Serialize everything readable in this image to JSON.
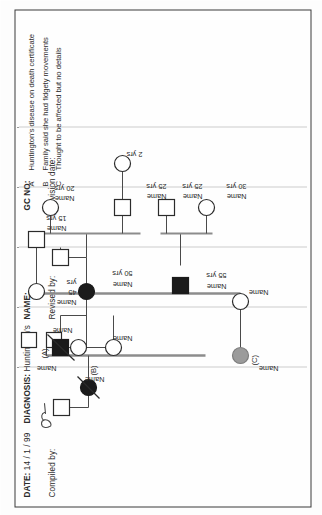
{
  "form": {
    "date_label": "DATE:",
    "date_value": "14 / 1 / 99",
    "diagnosis_label": "DIAGNOSIS:",
    "diagnosis_value": "Huntington's",
    "name_label": "NAME:",
    "gc_no_label": "GC NO:",
    "compiled_by_label": "Compiled by:",
    "compiled_by_value": "",
    "revised_by_label": "Revised  by:",
    "revision_date_label": "Revision  date:"
  },
  "legend": {
    "items": [
      {
        "key": "A",
        "text": "Huntington's disease on death certificate"
      },
      {
        "key": "B",
        "text": "Family said she had fidgety movements"
      },
      {
        "key": "C",
        "text": "Thought to be affected but no details"
      }
    ]
  },
  "pedigree": {
    "label_name": "Name",
    "note_a": "(A)",
    "note_b": "(B)",
    "note_c": "(C)",
    "ages": {
      "age_45": "45",
      "age_50": "50 yrs",
      "age_55": "55 yrs",
      "age_15": "15 yrs",
      "age_20": "20 yrs",
      "age_25a": "25 yrs",
      "age_25b": "25 yrs",
      "age_30": "30 yrs",
      "age_2": "2 yrs",
      "yrs_unit": "yrs"
    },
    "symbols": {
      "male": "square",
      "female": "circle",
      "affected_fill": "#1b1b1b",
      "unaffected_fill": "#ffffff",
      "possible_fill": "#9b9b9b",
      "stroke": "#2b2b2b",
      "deceased_mark": "slash"
    },
    "individuals": [
      {
        "id": "I-1",
        "sex": "male",
        "status": "unaffected",
        "deceased": false,
        "label": "Name",
        "age": ""
      },
      {
        "id": "I-2",
        "sex": "female",
        "status": "affected",
        "deceased": true,
        "label": "Name",
        "age": "",
        "note": "(B)"
      },
      {
        "id": "II-1",
        "sex": "male",
        "status": "affected",
        "deceased": true,
        "label": "Name",
        "age": "",
        "note": "(A)"
      },
      {
        "id": "II-2",
        "sex": "female",
        "status": "unaffected",
        "deceased": false,
        "label": "Name",
        "age": ""
      },
      {
        "id": "II-3",
        "sex": "female",
        "status": "possible",
        "deceased": false,
        "label": "Name",
        "age": "",
        "note": "(C)"
      },
      {
        "id": "II-4",
        "sex": "female",
        "status": "unaffected",
        "deceased": false,
        "label": "Name",
        "age": ""
      },
      {
        "id": "III-1",
        "sex": "female",
        "status": "affected",
        "deceased": false,
        "label": "Name",
        "age": "50 yrs"
      },
      {
        "id": "III-2",
        "sex": "male",
        "status": "unaffected",
        "deceased": false,
        "label": "Name",
        "age": ""
      },
      {
        "id": "III-3",
        "sex": "male",
        "status": "affected",
        "deceased": false,
        "label": "Name",
        "age": "55 yrs"
      },
      {
        "id": "III-4",
        "sex": "female",
        "status": "unaffected",
        "deceased": false,
        "label": "Name",
        "age": "45"
      },
      {
        "id": "III-5",
        "sex": "male",
        "status": "unaffected",
        "deceased": false,
        "label": "Name",
        "age": "15 yrs"
      },
      {
        "id": "IV-1",
        "sex": "female",
        "status": "unaffected",
        "deceased": false,
        "label": "Name",
        "age": "20 yrs"
      },
      {
        "id": "IV-2",
        "sex": "male",
        "status": "unaffected",
        "deceased": false,
        "label": "Name",
        "age": "25 yrs"
      },
      {
        "id": "IV-3",
        "sex": "male",
        "status": "unaffected",
        "deceased": false,
        "label": "Name",
        "age": "25 yrs"
      },
      {
        "id": "IV-4",
        "sex": "female",
        "status": "unaffected",
        "deceased": false,
        "label": "Name",
        "age": "30 yrs"
      },
      {
        "id": "IV-5",
        "sex": "female",
        "status": "unaffected",
        "deceased": false,
        "label": "",
        "age": "2 yrs"
      },
      {
        "id": "IV-6",
        "sex": "male",
        "status": "unaffected",
        "deceased": false,
        "label": "Name",
        "age": ""
      },
      {
        "id": "IV-7",
        "sex": "male",
        "status": "unaffected",
        "deceased": false,
        "label": "Name",
        "age": ""
      },
      {
        "id": "IV-8",
        "sex": "female",
        "status": "unaffected",
        "deceased": false,
        "label": "Name",
        "age": ""
      }
    ]
  }
}
